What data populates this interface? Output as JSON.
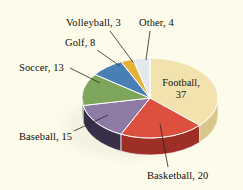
{
  "chart_data": {
    "type": "pie",
    "title": "",
    "subtitle": "",
    "xlabel": "",
    "ylabel": "",
    "legend_position": "none",
    "grid": false,
    "three_d": true,
    "start_angle_deg": 0,
    "direction": "clockwise",
    "total": 100,
    "categories": [
      "Football",
      "Basketball",
      "Baseball",
      "Soccer",
      "Golf",
      "Volleyball",
      "Other"
    ],
    "values": [
      37,
      20,
      15,
      13,
      8,
      3,
      4
    ],
    "labels": [
      "Football, 37",
      "Basketball, 20",
      "Baseball, 15",
      "Soccer, 13",
      "Golf, 8",
      "Volleyball, 3",
      "Other, 4"
    ],
    "slices": [
      {
        "name": "Football",
        "label": "Football,",
        "label_line2": "37",
        "value": 37,
        "color": "#f2e3ae",
        "side_color": "#d9c68c",
        "label_placement": "inside"
      },
      {
        "name": "Basketball",
        "label": "Basketball, 20",
        "value": 20,
        "color": "#dd4f3e",
        "side_color": "#9e2f26",
        "label_placement": "outside"
      },
      {
        "name": "Baseball",
        "label": "Baseball, 15",
        "value": 15,
        "color": "#8d7ba5",
        "side_color": "#3a2f48",
        "label_placement": "outside"
      },
      {
        "name": "Soccer",
        "label": "Soccer, 13",
        "value": 13,
        "color": "#7da55c",
        "side_color": "#55743c",
        "label_placement": "outside"
      },
      {
        "name": "Golf",
        "label": "Golf, 8",
        "value": 8,
        "color": "#4a7fb5",
        "side_color": "#2f5880",
        "label_placement": "outside"
      },
      {
        "name": "Volleyball",
        "label": "Volleyball, 3",
        "value": 3,
        "color": "#e5b337",
        "side_color": "#a87d1f",
        "label_placement": "outside"
      },
      {
        "name": "Other",
        "label": "Other, 4",
        "value": 4,
        "color": "#e3e7ee",
        "side_color": "#b9bfc9",
        "label_placement": "outside"
      }
    ],
    "colors": {
      "background": "#fdfbe9",
      "text": "#100c08",
      "leader_line": "#2a2620",
      "slice_outline": "#ffffff",
      "shadow": "#efecd6"
    }
  }
}
